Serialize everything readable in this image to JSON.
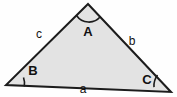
{
  "figure": {
    "name": "labeled-triangle",
    "canvas": {
      "width": 177,
      "height": 97
    },
    "colors": {
      "background": "#fefefe",
      "fill": "#e3e3e3",
      "stroke": "#1c1c1c",
      "label": "#111111",
      "edge_hairline": "#e8e8e8"
    },
    "geometry": {
      "vertices": {
        "A": {
          "x": 88,
          "y": 4
        },
        "B": {
          "x": 6,
          "y": 85
        },
        "C": {
          "x": 171,
          "y": 92
        }
      },
      "polygon_points": "88,4 171,92 6,85",
      "stroke_width": 2
    },
    "vertex_labels": [
      {
        "id": "A",
        "text": "A",
        "x": 88,
        "y": 31
      },
      {
        "id": "B",
        "text": "B",
        "x": 33,
        "y": 70
      },
      {
        "id": "C",
        "text": "C",
        "x": 147,
        "y": 79
      }
    ],
    "side_labels": [
      {
        "id": "a",
        "text": "a",
        "x": 83,
        "y": 89,
        "opposite_vertex": "A"
      },
      {
        "id": "b",
        "text": "b",
        "x": 132,
        "y": 41,
        "opposite_vertex": "B"
      },
      {
        "id": "c",
        "text": "c",
        "x": 39,
        "y": 34,
        "opposite_vertex": "C"
      }
    ],
    "angle_arcs": [
      {
        "id": "A",
        "path": "M 76.5 15.5 A 15 15 0 0 0 100.5 16.6"
      },
      {
        "id": "B",
        "path": "M 23.5 77.5 A 18 18 0 0 1 24.3 86.5"
      },
      {
        "id": "C",
        "path": "M 154.0 87.1 A 18 18 0 0 1 157.5 75.0"
      }
    ]
  }
}
